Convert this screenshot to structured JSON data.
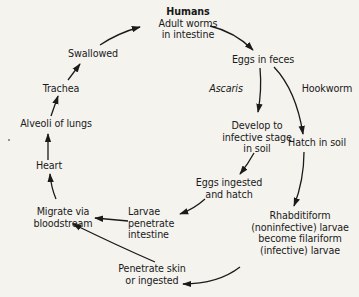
{
  "diagram": {
    "nodes": {
      "humans": {
        "title": "Humans",
        "lines": [
          "Adult worms",
          "in intestine"
        ]
      },
      "eggs_feces": {
        "lines": [
          "Eggs in feces"
        ]
      },
      "ascaris_label": {
        "lines": [
          "Ascaris"
        ]
      },
      "hookworm_label": {
        "lines": [
          "Hookworm"
        ]
      },
      "develop": {
        "lines": [
          "Develop to",
          "infective stage",
          "in soil"
        ]
      },
      "hatch_soil": {
        "lines": [
          "Hatch in soil"
        ]
      },
      "eggs_ingested": {
        "lines": [
          "Eggs ingested",
          "and hatch"
        ]
      },
      "rhabditiform": {
        "lines": [
          "Rhabditiform",
          "(noninfective) larvae",
          "become filariform",
          "(infective) larvae"
        ]
      },
      "larvae_penetrate": {
        "lines": [
          "Larvae",
          "penetrate",
          "intestine"
        ]
      },
      "migrate": {
        "lines": [
          "Migrate via",
          "bloodstream"
        ]
      },
      "penetrate_skin": {
        "lines": [
          "Penetrate skin",
          "or ingested"
        ]
      },
      "heart": {
        "lines": [
          "Heart"
        ]
      },
      "alveoli": {
        "lines": [
          "Alveoli of lungs"
        ]
      },
      "trachea": {
        "lines": [
          "Trachea"
        ]
      },
      "swallowed": {
        "lines": [
          "Swallowed"
        ]
      }
    },
    "edges": [
      [
        "humans",
        "eggs_feces"
      ],
      [
        "eggs_feces",
        "develop"
      ],
      [
        "eggs_feces",
        "hatch_soil"
      ],
      [
        "develop",
        "eggs_ingested"
      ],
      [
        "hatch_soil",
        "rhabditiform"
      ],
      [
        "eggs_ingested",
        "larvae_penetrate"
      ],
      [
        "larvae_penetrate",
        "migrate"
      ],
      [
        "rhabditiform",
        "penetrate_skin"
      ],
      [
        "penetrate_skin",
        "migrate"
      ],
      [
        "migrate",
        "heart"
      ],
      [
        "heart",
        "alveoli"
      ],
      [
        "alveoli",
        "trachea"
      ],
      [
        "trachea",
        "swallowed"
      ],
      [
        "swallowed",
        "humans"
      ]
    ],
    "colors": {
      "background": "#f4f3ee",
      "ink": "#1a1a1a"
    }
  }
}
